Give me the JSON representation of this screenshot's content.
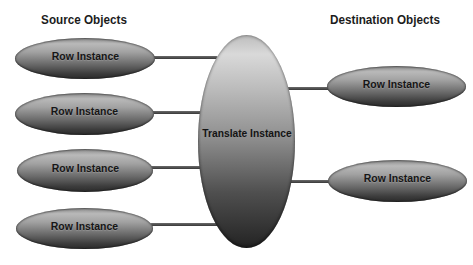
{
  "diagram": {
    "source_group": {
      "title": "Source Objects",
      "nodes": [
        {
          "label": "Row Instance"
        },
        {
          "label": "Row Instance"
        },
        {
          "label": "Row Instance"
        },
        {
          "label": "Row Instance"
        }
      ]
    },
    "center_node": {
      "label": "Translate Instance"
    },
    "destination_group": {
      "title": "Destination Objects",
      "nodes": [
        {
          "label": "Row Instance"
        },
        {
          "label": "Row Instance"
        }
      ]
    },
    "colors": {
      "background": "#ffffff",
      "ellipse_gradient_top": "#b9b9b9",
      "ellipse_gradient_bottom": "#2f2f2f",
      "center_gradient_top": "#d9d9d9",
      "center_gradient_bottom": "#232323",
      "connector": "#3f3f3f",
      "text": "#161616"
    }
  }
}
